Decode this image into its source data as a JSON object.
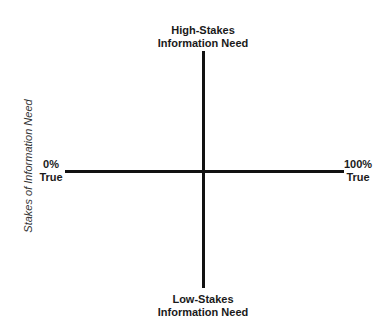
{
  "diagram": {
    "type": "quadrant",
    "top_label": [
      "High-Stakes",
      "Information Need"
    ],
    "bottom_label": [
      "Low-Stakes",
      "Information Need"
    ],
    "left_label": [
      "0%",
      "True"
    ],
    "right_label": [
      "100%",
      "True"
    ],
    "y_axis_title": "Stakes of Information Need",
    "line_color": "#111111"
  }
}
